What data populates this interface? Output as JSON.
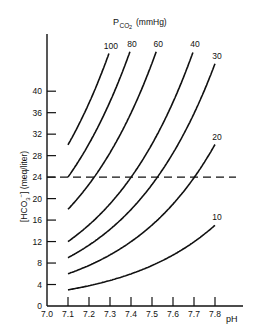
{
  "chart_data": {
    "type": "line",
    "title_main": "P",
    "title_sub": "CO",
    "title_sub2": "2",
    "title_unit": "(mmHg)",
    "xlabel": "pH",
    "ylabel": "[HCO3-] (meq/liter)",
    "ylabel_parts": {
      "pre": "[HCO",
      "sub": "3",
      "sup": "−",
      "post": "] (meq/liter)"
    },
    "xlim": [
      7.0,
      7.8
    ],
    "ylim": [
      0,
      44
    ],
    "x_ticks": [
      "7.0",
      "7.1",
      "7.2",
      "7.3",
      "7.4",
      "7.5",
      "7.6",
      "7.7",
      "7.8"
    ],
    "y_ticks": [
      "0",
      "4",
      "8",
      "12",
      "16",
      "20",
      "24",
      "28",
      "32",
      "36",
      "40"
    ],
    "reference_line": {
      "y": 24,
      "style": "dashed"
    },
    "grid": false,
    "series": [
      {
        "name": "100",
        "pco2": 100,
        "x": [
          7.1,
          7.2,
          7.3,
          7.4
        ],
        "values": [
          30,
          37.8,
          47.6,
          59.9
        ]
      },
      {
        "name": "80",
        "pco2": 80,
        "x": [
          7.1,
          7.2,
          7.3,
          7.4,
          7.5
        ],
        "values": [
          24,
          30.2,
          38.0,
          47.9,
          60.3
        ]
      },
      {
        "name": "60",
        "pco2": 60,
        "x": [
          7.1,
          7.2,
          7.3,
          7.4,
          7.5,
          7.6
        ],
        "values": [
          18,
          22.7,
          28.5,
          35.9,
          45.2,
          56.9
        ]
      },
      {
        "name": "40",
        "pco2": 40,
        "x": [
          7.1,
          7.2,
          7.3,
          7.4,
          7.5,
          7.6,
          7.7
        ],
        "values": [
          12,
          15.1,
          19.0,
          23.9,
          30.1,
          37.9,
          47.7
        ]
      },
      {
        "name": "30",
        "pco2": 30,
        "x": [
          7.1,
          7.2,
          7.3,
          7.4,
          7.5,
          7.6,
          7.7,
          7.8
        ],
        "values": [
          9,
          11.3,
          14.3,
          17.9,
          22.6,
          28.5,
          35.8,
          45.1
        ]
      },
      {
        "name": "20",
        "pco2": 20,
        "x": [
          7.1,
          7.2,
          7.3,
          7.4,
          7.5,
          7.6,
          7.7,
          7.8
        ],
        "values": [
          6,
          7.6,
          9.5,
          12.0,
          15.1,
          19.0,
          23.9,
          30.1
        ]
      },
      {
        "name": "10",
        "pco2": 10,
        "x": [
          7.1,
          7.2,
          7.3,
          7.4,
          7.5,
          7.6,
          7.7,
          7.8
        ],
        "values": [
          3,
          3.8,
          4.8,
          6.0,
          7.5,
          9.5,
          11.9,
          15.1
        ]
      }
    ]
  }
}
